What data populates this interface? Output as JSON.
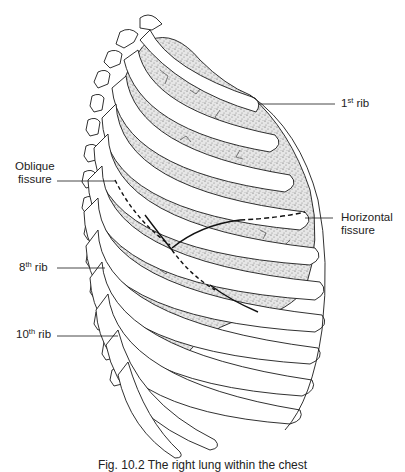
{
  "figure": {
    "labels": {
      "rib1": {
        "num": "1",
        "sup": "st",
        "text": " rib"
      },
      "oblique": {
        "line1": "Oblique",
        "line2": "fissure"
      },
      "horizontal": {
        "line1": "Horizontal",
        "line2": "fissure"
      },
      "rib8": {
        "num": "8",
        "sup": "th",
        "text": " rib"
      },
      "rib10": {
        "num": "10",
        "sup": "th",
        "text": " rib"
      }
    },
    "caption": "Fig. 10.2  The right lung within the chest"
  },
  "colors": {
    "line": "#1a1a1a",
    "lung_fill": "#cfcfcf",
    "rib_fill": "#ffffff"
  }
}
